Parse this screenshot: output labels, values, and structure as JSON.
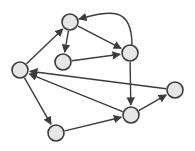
{
  "diagram": {
    "type": "directed-graph",
    "node_radius": 8,
    "colors": {
      "node_fill": "#e6e6e6",
      "stroke": "#3c3c3c",
      "background": "#ffffff"
    },
    "nodes": [
      {
        "id": "top",
        "x": 70,
        "y": 22
      },
      {
        "id": "mid",
        "x": 63,
        "y": 62
      },
      {
        "id": "upper-right",
        "x": 130,
        "y": 53
      },
      {
        "id": "left",
        "x": 20,
        "y": 70
      },
      {
        "id": "far-right",
        "x": 175,
        "y": 90
      },
      {
        "id": "bottom-right",
        "x": 131,
        "y": 115
      },
      {
        "id": "bottom-left",
        "x": 56,
        "y": 133
      }
    ],
    "edges": [
      {
        "from": "left",
        "to": "top"
      },
      {
        "from": "top",
        "to": "mid"
      },
      {
        "from": "top",
        "to": "upper-right"
      },
      {
        "from": "upper-right",
        "to": "top",
        "curved": true
      },
      {
        "from": "mid",
        "to": "upper-right"
      },
      {
        "from": "upper-right",
        "to": "bottom-right"
      },
      {
        "from": "far-right",
        "to": "left"
      },
      {
        "from": "bottom-right",
        "to": "left"
      },
      {
        "from": "left",
        "to": "bottom-left"
      },
      {
        "from": "bottom-left",
        "to": "bottom-right"
      },
      {
        "from": "bottom-right",
        "to": "far-right"
      }
    ]
  }
}
